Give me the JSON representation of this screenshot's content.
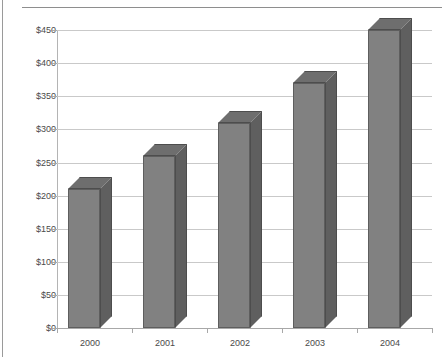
{
  "chart_data": {
    "type": "bar",
    "title": "",
    "subtitle": "",
    "xlabel": "",
    "ylabel": "",
    "categories": [
      "2000",
      "2001",
      "2002",
      "2003",
      "2004"
    ],
    "values": [
      210,
      260,
      310,
      370,
      450
    ],
    "ylim": [
      0,
      450
    ],
    "y_ticks": [
      0,
      50,
      100,
      150,
      200,
      250,
      300,
      350,
      400,
      450
    ],
    "y_tick_labels": [
      "$0",
      "$50",
      "$100",
      "$150",
      "$200",
      "$250",
      "$300",
      "$350",
      "$400",
      "$450"
    ],
    "currency_prefix": "$",
    "grid": true,
    "grid_axis": "y",
    "legend": false,
    "legend_position": "none",
    "style": "3d-column",
    "series": [
      {
        "name": "",
        "values": [
          210,
          260,
          310,
          370,
          450
        ]
      }
    ],
    "colors": {
      "bar_front": "#818181",
      "bar_side": "#5f5f5f",
      "bar_top": "#6e6e6e",
      "bar_outline": "#5e5e5e",
      "gridline": "#c9c9c9",
      "axis": "#a8a8a8",
      "background": "#ffffff",
      "text": "#4a4a4a"
    }
  }
}
